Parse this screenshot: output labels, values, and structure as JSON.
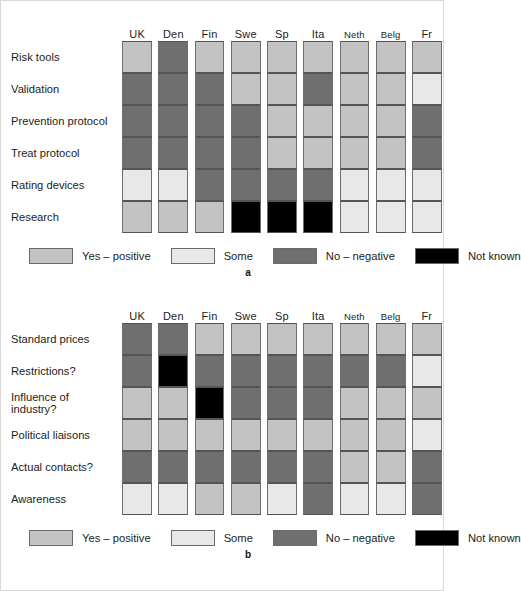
{
  "figure": {
    "background": "#ffffff",
    "border_color": "#d8d8d8"
  },
  "palette": {
    "yes": "#c3c3c3",
    "some": "#e8e8e8",
    "no": "#6f6f6f",
    "unknown": "#000000"
  },
  "legend": {
    "items": [
      {
        "key": "yes",
        "label": "Yes – positive",
        "color": "#c3c3c3"
      },
      {
        "key": "some",
        "label": "Some",
        "color": "#e8e8e8"
      },
      {
        "key": "no",
        "label": "No – negative",
        "color": "#6f6f6f"
      },
      {
        "key": "unknown",
        "label": "Not known",
        "color": "#000000"
      }
    ]
  },
  "panel_a": {
    "caption": "a",
    "columns": [
      "UK",
      "Den",
      "Fin",
      "Swe",
      "Sp",
      "Ita",
      "Neth",
      "Belg",
      "Fr"
    ],
    "rows": [
      "Risk tools",
      "Validation",
      "Prevention protocol",
      "Treat protocol",
      "Rating devices",
      "Research"
    ]
  },
  "panel_b": {
    "caption": "b",
    "columns": [
      "UK",
      "Den",
      "Fin",
      "Swe",
      "Sp",
      "Ita",
      "Neth",
      "Belg",
      "Fr"
    ],
    "rows": [
      "Standard prices",
      "Restrictions?",
      "Influence of industry?",
      "Political liaisons",
      "Actual contacts?",
      "Awareness"
    ]
  },
  "chart_data": [
    {
      "type": "heatmap",
      "title": "a",
      "xlabel": "",
      "ylabel": "",
      "legend_position": "below",
      "grid": false,
      "categories_x": [
        "UK",
        "Den",
        "Fin",
        "Swe",
        "Sp",
        "Ita",
        "Neth",
        "Belg",
        "Fr"
      ],
      "categories_y": [
        "Risk tools",
        "Validation",
        "Prevention protocol",
        "Treat protocol",
        "Rating devices",
        "Research"
      ],
      "value_scale": {
        "yes": "Yes – positive",
        "some": "Some",
        "no": "No – negative",
        "unknown": "Not known"
      },
      "values": [
        [
          "yes",
          "no",
          "yes",
          "yes",
          "yes",
          "yes",
          "yes",
          "yes",
          "yes"
        ],
        [
          "no",
          "no",
          "no",
          "yes",
          "yes",
          "no",
          "yes",
          "yes",
          "some"
        ],
        [
          "no",
          "no",
          "no",
          "no",
          "yes",
          "yes",
          "yes",
          "yes",
          "no"
        ],
        [
          "no",
          "no",
          "no",
          "no",
          "yes",
          "yes",
          "yes",
          "yes",
          "no"
        ],
        [
          "some",
          "some",
          "no",
          "no",
          "no",
          "no",
          "some",
          "some",
          "some"
        ],
        [
          "yes",
          "yes",
          "yes",
          "unknown",
          "unknown",
          "unknown",
          "some",
          "some",
          "some"
        ]
      ]
    },
    {
      "type": "heatmap",
      "title": "b",
      "xlabel": "",
      "ylabel": "",
      "legend_position": "below",
      "grid": false,
      "categories_x": [
        "UK",
        "Den",
        "Fin",
        "Swe",
        "Sp",
        "Ita",
        "Neth",
        "Belg",
        "Fr"
      ],
      "categories_y": [
        "Standard prices",
        "Restrictions?",
        "Influence of industry?",
        "Political liaisons",
        "Actual contacts?",
        "Awareness"
      ],
      "value_scale": {
        "yes": "Yes – positive",
        "some": "Some",
        "no": "No – negative",
        "unknown": "Not known"
      },
      "values": [
        [
          "no",
          "no",
          "yes",
          "yes",
          "yes",
          "yes",
          "yes",
          "yes",
          "yes"
        ],
        [
          "no",
          "unknown",
          "no",
          "no",
          "no",
          "no",
          "no",
          "no",
          "some"
        ],
        [
          "yes",
          "yes",
          "unknown",
          "no",
          "no",
          "no",
          "yes",
          "yes",
          "yes"
        ],
        [
          "yes",
          "yes",
          "yes",
          "yes",
          "yes",
          "yes",
          "yes",
          "yes",
          "some"
        ],
        [
          "no",
          "no",
          "no",
          "no",
          "no",
          "no",
          "yes",
          "yes",
          "no"
        ],
        [
          "some",
          "some",
          "yes",
          "yes",
          "some",
          "no",
          "some",
          "some",
          "no"
        ]
      ]
    }
  ]
}
